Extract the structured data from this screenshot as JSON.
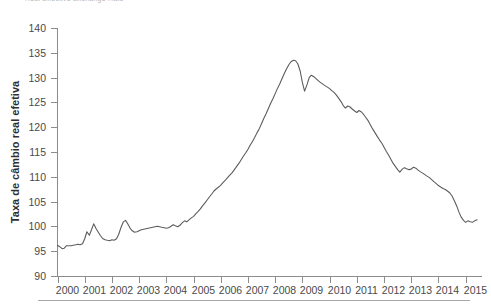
{
  "figure": {
    "top_caption_fragment": "Real Effective Exchange Rate",
    "background_color": "#ffffff"
  },
  "axes": {
    "y_axis_title": "Taxa de câmbio real efetiva",
    "y_tick_labels": [
      "140",
      "135",
      "130",
      "125",
      "120",
      "115",
      "110",
      "105",
      "100",
      "95",
      "90"
    ],
    "x_tick_labels": [
      "2000",
      "2001",
      "2002",
      "2003",
      "2004",
      "2005",
      "2006",
      "2007",
      "2008",
      "2009",
      "2010",
      "2011",
      "2012",
      "2013",
      "2014",
      "2015"
    ]
  },
  "style": {
    "line_color": "#5c5c5c",
    "axis_color": "#8c8c8c",
    "text_color": "#4a4a4a",
    "rule_color": "#a8a8a8"
  },
  "chart_data": {
    "type": "line",
    "title": "",
    "xlabel": "",
    "ylabel": "Taxa de câmbio real efetiva",
    "xlim": [
      2000,
      2015.6
    ],
    "ylim": [
      90,
      140
    ],
    "ytick_step": 5,
    "grid": false,
    "legend": false,
    "series": [
      {
        "name": "Taxa de câmbio real efetiva",
        "x": [
          2000.0,
          2000.08,
          2000.17,
          2000.25,
          2000.33,
          2000.42,
          2000.5,
          2000.58,
          2000.67,
          2000.75,
          2000.83,
          2000.92,
          2001.0,
          2001.08,
          2001.17,
          2001.25,
          2001.33,
          2001.42,
          2001.5,
          2001.58,
          2001.67,
          2001.75,
          2001.83,
          2001.92,
          2002.0,
          2002.08,
          2002.17,
          2002.25,
          2002.33,
          2002.42,
          2002.5,
          2002.58,
          2002.67,
          2002.75,
          2002.83,
          2002.92,
          2003.0,
          2003.08,
          2003.17,
          2003.25,
          2003.33,
          2003.42,
          2003.5,
          2003.58,
          2003.67,
          2003.75,
          2003.83,
          2003.92,
          2004.0,
          2004.08,
          2004.17,
          2004.25,
          2004.33,
          2004.42,
          2004.5,
          2004.58,
          2004.67,
          2004.75,
          2004.83,
          2004.92,
          2005.0,
          2005.08,
          2005.17,
          2005.25,
          2005.33,
          2005.42,
          2005.5,
          2005.58,
          2005.67,
          2005.75,
          2005.83,
          2005.92,
          2006.0,
          2006.08,
          2006.17,
          2006.25,
          2006.33,
          2006.42,
          2006.5,
          2006.58,
          2006.67,
          2006.75,
          2006.83,
          2006.92,
          2007.0,
          2007.08,
          2007.17,
          2007.25,
          2007.33,
          2007.42,
          2007.5,
          2007.58,
          2007.67,
          2007.75,
          2007.83,
          2007.92,
          2008.0,
          2008.08,
          2008.17,
          2008.25,
          2008.33,
          2008.42,
          2008.5,
          2008.58,
          2008.67,
          2008.75,
          2008.83,
          2008.92,
          2009.0,
          2009.08,
          2009.17,
          2009.25,
          2009.33,
          2009.42,
          2009.5,
          2009.58,
          2009.67,
          2009.75,
          2009.83,
          2009.92,
          2010.0,
          2010.08,
          2010.17,
          2010.25,
          2010.33,
          2010.42,
          2010.5,
          2010.58,
          2010.67,
          2010.75,
          2010.83,
          2010.92,
          2011.0,
          2011.08,
          2011.17,
          2011.25,
          2011.33,
          2011.42,
          2011.5,
          2011.58,
          2011.67,
          2011.75,
          2011.83,
          2011.92,
          2012.0,
          2012.08,
          2012.17,
          2012.25,
          2012.33,
          2012.42,
          2012.5,
          2012.58,
          2012.67,
          2012.75,
          2012.83,
          2012.92,
          2013.0,
          2013.08,
          2013.17,
          2013.25,
          2013.33,
          2013.42,
          2013.5,
          2013.58,
          2013.67,
          2013.75,
          2013.83,
          2013.92,
          2014.0,
          2014.08,
          2014.17,
          2014.25,
          2014.33,
          2014.42,
          2014.5,
          2014.58,
          2014.67,
          2014.75,
          2014.83,
          2014.92,
          2015.0,
          2015.08,
          2015.17,
          2015.25,
          2015.33,
          2015.42
        ],
        "values": [
          96.3,
          96.0,
          95.6,
          95.7,
          96.2,
          96.2,
          96.2,
          96.3,
          96.4,
          96.5,
          96.4,
          96.6,
          97.6,
          99.0,
          98.3,
          99.4,
          100.6,
          99.6,
          98.9,
          98.2,
          97.6,
          97.4,
          97.3,
          97.2,
          97.4,
          97.3,
          97.6,
          98.5,
          99.8,
          101.0,
          101.3,
          100.6,
          99.7,
          99.2,
          98.9,
          99.0,
          99.2,
          99.4,
          99.5,
          99.6,
          99.7,
          99.8,
          99.9,
          100.0,
          100.1,
          100.0,
          99.9,
          99.8,
          99.7,
          99.8,
          100.1,
          100.4,
          100.2,
          100.0,
          100.3,
          100.8,
          101.2,
          101.0,
          101.4,
          101.8,
          102.1,
          102.6,
          103.1,
          103.6,
          104.2,
          104.8,
          105.4,
          106.0,
          106.6,
          107.2,
          107.6,
          108.0,
          108.4,
          108.9,
          109.4,
          109.9,
          110.4,
          110.9,
          111.5,
          112.1,
          112.8,
          113.5,
          114.2,
          114.9,
          115.6,
          116.4,
          117.2,
          118.0,
          118.9,
          119.8,
          120.8,
          121.8,
          122.8,
          123.8,
          124.8,
          125.8,
          126.8,
          127.8,
          128.8,
          129.8,
          130.8,
          131.8,
          132.6,
          133.2,
          133.5,
          133.4,
          132.8,
          131.3,
          129.0,
          127.3,
          128.6,
          130.0,
          130.5,
          130.2,
          129.8,
          129.4,
          129.0,
          128.7,
          128.4,
          128.1,
          127.8,
          127.4,
          127.0,
          126.5,
          125.9,
          125.2,
          124.4,
          123.9,
          124.3,
          124.1,
          123.7,
          123.3,
          123.0,
          123.4,
          123.1,
          122.6,
          122.0,
          121.3,
          120.5,
          119.7,
          118.9,
          118.2,
          117.5,
          116.8,
          116.0,
          115.2,
          114.4,
          113.6,
          112.8,
          112.1,
          111.5,
          111.0,
          111.6,
          111.9,
          111.7,
          111.5,
          111.6,
          112.0,
          111.8,
          111.4,
          111.1,
          110.8,
          110.5,
          110.2,
          109.9,
          109.5,
          109.1,
          108.7,
          108.3,
          108.0,
          107.7,
          107.5,
          107.2,
          106.8,
          106.2,
          105.3,
          104.2,
          103.0,
          102.0,
          101.3,
          100.9,
          101.2,
          101.0,
          100.9,
          101.2,
          101.4
        ]
      }
    ]
  }
}
